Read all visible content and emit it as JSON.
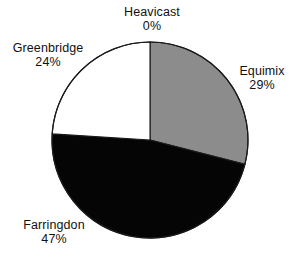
{
  "chart_data": {
    "type": "pie",
    "title": "",
    "categories": [
      "Heavicast",
      "Equimix",
      "Farringdon",
      "Greenbridge"
    ],
    "values": [
      0,
      29,
      47,
      24
    ],
    "value_labels": [
      "0%",
      "29%",
      "47%",
      "24%"
    ],
    "units": "percent",
    "start_angle_deg": 0,
    "direction": "clockwise",
    "legend": "none",
    "grid": false,
    "slices": [
      {
        "name": "Heavicast",
        "value": 0,
        "value_label": "0%",
        "color": "#ffffff",
        "start_deg": 0,
        "end_deg": 0
      },
      {
        "name": "Equimix",
        "value": 29,
        "value_label": "29%",
        "color": "#8c8c8c",
        "start_deg": 0,
        "end_deg": 104.4
      },
      {
        "name": "Farringdon",
        "value": 47,
        "value_label": "47%",
        "color": "#050505",
        "start_deg": 104.4,
        "end_deg": 273.6
      },
      {
        "name": "Greenbridge",
        "value": 24,
        "value_label": "24%",
        "color": "#ffffff",
        "start_deg": 273.6,
        "end_deg": 360
      }
    ],
    "geometry": {
      "center_x": 150,
      "center_y": 140,
      "radius": 98
    },
    "outline_color": "#1a1a1a",
    "background_color": "#ffffff"
  },
  "labels": {
    "heavicast": {
      "name": "Heavicast",
      "value": "0%"
    },
    "equimix": {
      "name": "Equimix",
      "value": "29%"
    },
    "farringdon": {
      "name": "Farringdon",
      "value": "47%"
    },
    "greenbridge": {
      "name": "Greenbridge",
      "value": "24%"
    }
  }
}
